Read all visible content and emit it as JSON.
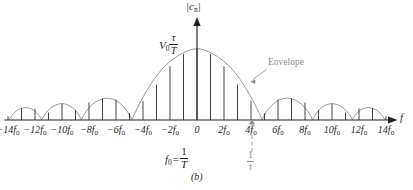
{
  "figure": {
    "caption": "(b)",
    "y_axis_label": "|c",
    "y_axis_label_sub": "n",
    "y_axis_label_tail": "|",
    "x_axis_label": "f",
    "amplitude_label": "V",
    "amplitude_label_sub": "0",
    "amplitude_frac_num": "τ",
    "amplitude_frac_den": "T",
    "envelope_label": "Envelope",
    "f0_relation_lhs": "f",
    "f0_relation_lhs_sub": "0",
    "f0_relation_eq": "=",
    "f0_relation_num": "1",
    "f0_relation_den": "T",
    "inv_tau_num": "1",
    "inv_tau_den": "τ",
    "colors": {
      "ink": "#231f20",
      "grey": "#8d8d8d",
      "background": "#ffffff"
    },
    "tick_labels": [
      {
        "text": "−14f",
        "sub": "0",
        "x": -14
      },
      {
        "text": "−12f",
        "sub": "0",
        "x": -12
      },
      {
        "text": "−10f",
        "sub": "0",
        "x": -10
      },
      {
        "text": "−8f",
        "sub": "0",
        "x": -8
      },
      {
        "text": "−6f",
        "sub": "0",
        "x": -6
      },
      {
        "text": "−4f",
        "sub": "0",
        "x": -4
      },
      {
        "text": "−2f",
        "sub": "0",
        "x": -2
      },
      {
        "text": "0",
        "sub": "",
        "x": 0
      },
      {
        "text": "2f",
        "sub": "0",
        "x": 2
      },
      {
        "text": "4f",
        "sub": "0",
        "x": 4
      },
      {
        "text": "6f",
        "sub": "0",
        "x": 6
      },
      {
        "text": "8f",
        "sub": "0",
        "x": 8
      },
      {
        "text": "10f",
        "sub": "0",
        "x": 10
      },
      {
        "text": "12f",
        "sub": "0",
        "x": 12
      },
      {
        "text": "14f",
        "sub": "0",
        "x": 14
      }
    ]
  },
  "chart_data": {
    "type": "line",
    "title": "",
    "xlabel": "f",
    "ylabel": "|c_n|",
    "xlim": [
      -14.6,
      14.6
    ],
    "ylim": [
      0,
      1.0
    ],
    "grid": false,
    "legend": "Envelope",
    "envelope": {
      "form": "abs_sinc",
      "null_spacing_in_f0": 4.5,
      "peak_value": 1.0,
      "peak_at": 0
    },
    "x_in_f0": [
      -14,
      -13,
      -12,
      -11,
      -10,
      -9,
      -8,
      -7,
      -6,
      -5,
      -4,
      -3,
      -2,
      -1,
      0,
      1,
      2,
      3,
      4,
      5,
      6,
      7,
      8,
      9,
      10,
      11,
      12,
      13,
      14
    ],
    "values": [
      0.055,
      0.069,
      0.072,
      0.061,
      0.039,
      0.011,
      0.049,
      0.085,
      0.103,
      0.098,
      0.071,
      0.259,
      0.534,
      0.816,
      1.0,
      0.816,
      0.534,
      0.259,
      0.071,
      0.098,
      0.103,
      0.085,
      0.049,
      0.011,
      0.039,
      0.061,
      0.072,
      0.069,
      0.055
    ],
    "annotations": [
      {
        "text": "V_0 τ/T",
        "at": [
          0,
          1.0
        ]
      },
      {
        "text": "Envelope",
        "at": [
          6.4,
          0.62
        ]
      },
      {
        "text": "f_0 = 1/T",
        "at": [
          0,
          -0.42
        ]
      },
      {
        "text": "1/τ",
        "at": [
          4.5,
          -0.42
        ]
      },
      {
        "text": "(b)",
        "at": [
          0,
          -0.72
        ]
      }
    ]
  }
}
